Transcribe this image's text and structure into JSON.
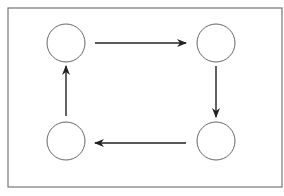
{
  "diagram": {
    "type": "cycle",
    "frame": {
      "x": 8,
      "y": 8,
      "width": 274,
      "height": 179,
      "stroke": "#777777"
    },
    "nodes": [
      {
        "id": "top-left",
        "cx": 66,
        "cy": 43,
        "r": 19,
        "label": ""
      },
      {
        "id": "top-right",
        "cx": 216,
        "cy": 43,
        "r": 19,
        "label": ""
      },
      {
        "id": "bottom-right",
        "cx": 216,
        "cy": 141,
        "r": 19,
        "label": ""
      },
      {
        "id": "bottom-left",
        "cx": 66,
        "cy": 141,
        "r": 19,
        "label": ""
      }
    ],
    "edges": [
      {
        "from": "top-left",
        "to": "top-right",
        "x1": 95,
        "y1": 43,
        "x2": 186,
        "y2": 43
      },
      {
        "from": "top-right",
        "to": "bottom-right",
        "x1": 216,
        "y1": 66,
        "x2": 216,
        "y2": 117
      },
      {
        "from": "bottom-right",
        "to": "bottom-left",
        "x1": 186,
        "y1": 143,
        "x2": 95,
        "y2": 143
      },
      {
        "from": "bottom-left",
        "to": "top-left",
        "x1": 66,
        "y1": 116,
        "x2": 66,
        "y2": 66
      }
    ],
    "colors": {
      "node_stroke": "#666666",
      "edge": "#222222"
    }
  }
}
